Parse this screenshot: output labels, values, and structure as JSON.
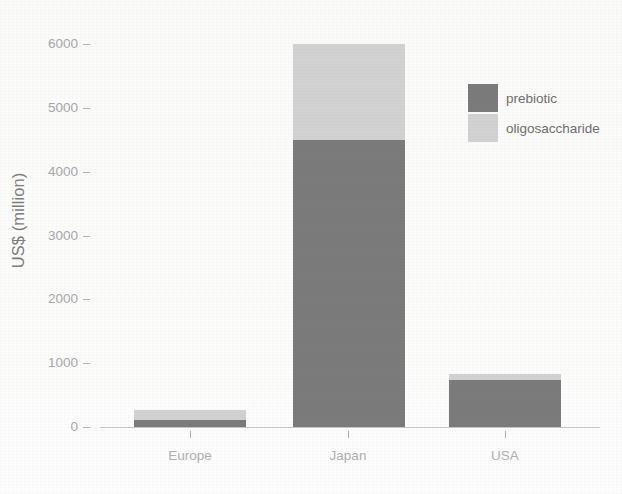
{
  "chart_data": {
    "type": "bar",
    "subtype": "stacked-vertical",
    "title": "",
    "subtitle": "",
    "xlabel": "",
    "ylabel": "US$ (million)",
    "categories": [
      "Europe",
      "Japan",
      "USA"
    ],
    "series": [
      {
        "name": "prebiotic",
        "values": [
          110,
          4500,
          735
        ],
        "color": "#7b7b7b"
      },
      {
        "name": "oligosaccharide",
        "values": [
          155,
          1500,
          95
        ],
        "color": "#d2d2d2"
      }
    ],
    "totals": [
      265,
      6000,
      830
    ],
    "ylim": [
      0,
      6000
    ],
    "ytick_labels": [
      "0",
      "1000",
      "2000",
      "3000",
      "4000",
      "5000",
      "6000"
    ],
    "ytick_values": [
      0,
      1000,
      2000,
      3000,
      4000,
      5000,
      6000
    ],
    "grid": false,
    "legend_position": "top-right",
    "legend_entries": [
      "prebiotic",
      "oligosaccharide"
    ]
  },
  "axes": {
    "y_title": "US$ (million)",
    "y_ticks": [
      {
        "label": "6000",
        "value": 6000
      },
      {
        "label": "5000",
        "value": 5000
      },
      {
        "label": "4000",
        "value": 4000
      },
      {
        "label": "3000",
        "value": 3000
      },
      {
        "label": "2000",
        "value": 2000
      },
      {
        "label": "1000",
        "value": 1000
      },
      {
        "label": "0",
        "value": 0
      }
    ],
    "x_ticks": [
      {
        "label": "Europe"
      },
      {
        "label": "Japan"
      },
      {
        "label": "USA"
      }
    ]
  },
  "legend": {
    "items": [
      {
        "label": "prebiotic",
        "swatch_name": "legend-swatch-prebiotic"
      },
      {
        "label": "oligosaccharide",
        "swatch_name": "legend-swatch-oligosaccharide"
      }
    ]
  },
  "colors": {
    "prebiotic": "#7b7b7b",
    "oligosaccharide": "#d2d2d2",
    "axis_text": "#a8a8a8",
    "axis_title": "#7d7d7d",
    "axis_line": "#c9c9c9",
    "background": "#fdfdfd"
  },
  "geometry": {
    "baseline_y": 427,
    "top_y": 44,
    "px_per_1000": 63.8,
    "bars": [
      {
        "category": "Europe",
        "left": 134,
        "width": 112,
        "tick_x": 190
      },
      {
        "category": "Japan",
        "left": 293,
        "width": 112,
        "tick_x": 348
      },
      {
        "category": "USA",
        "left": 449,
        "width": 112,
        "tick_x": 505
      }
    ]
  }
}
